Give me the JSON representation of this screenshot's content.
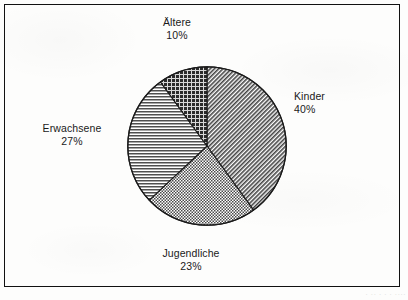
{
  "figure": {
    "background_color": "#fdfdfc",
    "frame_color": "#111111",
    "text_color": "#1a1a1a",
    "bottom_caption": "· ·· · · · ····"
  },
  "chart_data": {
    "type": "pie",
    "title": "",
    "subtitle": "",
    "xlabel": "",
    "ylabel": "",
    "grid": false,
    "legend_position": "outside-labels",
    "start_angle_deg": 0,
    "direction": "clockwise",
    "center_px": [
      207,
      146
    ],
    "radius_px": 80,
    "categories": [
      "Kinder",
      "Jugendliche",
      "Erwachsene",
      "Ältere"
    ],
    "values": [
      40,
      23,
      27,
      10
    ],
    "unit": "%",
    "slices": [
      {
        "label": "Kinder",
        "value": 40,
        "pct_text": "40%",
        "pattern": "diagonal-hatch",
        "fill": "#6e6e6e",
        "start_deg": 0,
        "end_deg": 144
      },
      {
        "label": "Jugendliche",
        "value": 23,
        "pct_text": "23%",
        "pattern": "fine-checker",
        "fill": "#8a8a8a",
        "start_deg": 144,
        "end_deg": 226.8
      },
      {
        "label": "Erwachsene",
        "value": 27,
        "pct_text": "27%",
        "pattern": "horizontal-lines",
        "fill": "#949494",
        "start_deg": 226.8,
        "end_deg": 324
      },
      {
        "label": "Ältere",
        "value": 10,
        "pct_text": "10%",
        "pattern": "dark-crosshatch",
        "fill": "#3a3a3a",
        "start_deg": 324,
        "end_deg": 360
      }
    ]
  },
  "labels": {
    "aeltere": {
      "name": "Ältere",
      "pct": "10%"
    },
    "kinder": {
      "name": "Kinder",
      "pct": "40%"
    },
    "erwachsene": {
      "name": "Erwachsene",
      "pct": "27%"
    },
    "jugendliche": {
      "name": "Jugendliche",
      "pct": "23%"
    }
  }
}
